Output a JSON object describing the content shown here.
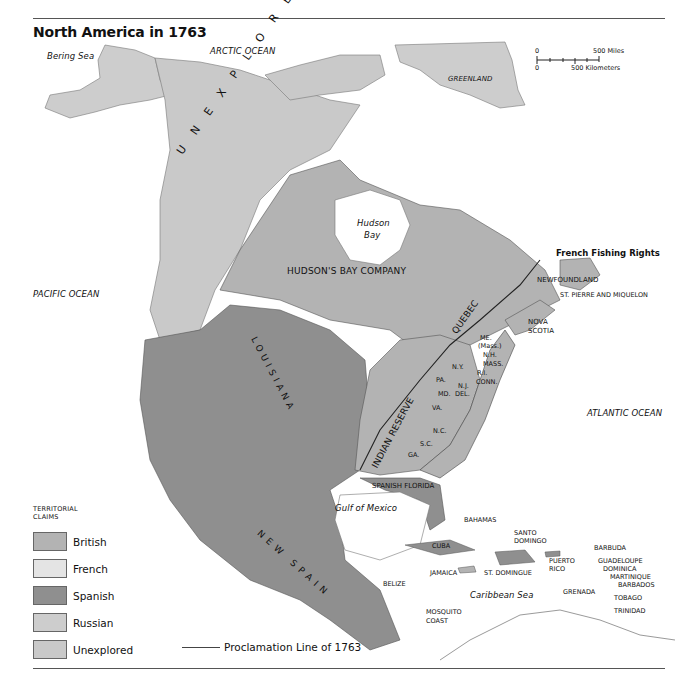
{
  "title": "North America in 1763",
  "colors": {
    "british": "#b3b3b3",
    "french": "#e4e4e4",
    "spanish": "#8f8f8f",
    "russian": "#cdcdcd",
    "unexplored": "#c9c9c9",
    "water": "#ffffff",
    "border": "#444444"
  },
  "scale": {
    "miles_zero": "0",
    "miles_label": "500 Miles",
    "km_zero": "0",
    "km_label": "500 Kilometers"
  },
  "oceans": {
    "bering": "Bering Sea",
    "arctic": "ARCTIC OCEAN",
    "pacific": "PACIFIC OCEAN",
    "atlantic": "ATLANTIC OCEAN",
    "gulf": "Gulf of Mexico",
    "caribbean": "Caribbean Sea",
    "hudson": "Hudson",
    "hudson2": "Bay"
  },
  "regions": {
    "greenland": "GREENLAND",
    "unexplored": "U N E X P L O R E D",
    "hbc": "HUDSON'S BAY COMPANY",
    "quebec": "QUEBEC",
    "louisiana": "LOUISIANA",
    "indian_reserve": "INDIAN RESERVE",
    "new_spain": "NEW SPAIN",
    "spanish_florida": "SPANISH FLORIDA",
    "newfoundland": "NEWFOUNDLAND",
    "st_pierre": "ST. PIERRE AND MIQUELON",
    "nova_scotia_1": "NOVA",
    "nova_scotia_2": "SCOTIA",
    "french_fishing": "French Fishing Rights",
    "belize": "BELIZE",
    "mosquito_1": "MOSQUITO",
    "mosquito_2": "COAST"
  },
  "colonies": {
    "me": "ME.",
    "mass_paren": "(Mass.)",
    "nh": "N.H.",
    "mass": "MASS.",
    "ri": "R.I.",
    "conn": "CONN.",
    "ny": "N.Y.",
    "pa": "PA.",
    "nj": "N.J.",
    "md": "MD.",
    "del": "DEL.",
    "va": "VA.",
    "nc": "N.C.",
    "sc": "S.C.",
    "ga": "GA."
  },
  "caribbean": {
    "bahamas": "BAHAMAS",
    "cuba": "CUBA",
    "jamaica": "JAMAICA",
    "santo_1": "SANTO",
    "santo_2": "DOMINGO",
    "st_domingue": "ST. DOMINGUE",
    "puerto_1": "PUERTO",
    "puerto_2": "RICO",
    "barbuda": "BARBUDA",
    "guadeloupe": "GUADELOUPE",
    "dominica": "DOMINICA",
    "martinique": "MARTINIQUE",
    "barbados": "BARBADOS",
    "grenada": "GRENADA",
    "tobago": "TOBAGO",
    "trinidad": "TRINIDAD"
  },
  "legend": {
    "heading_1": "TERRITORIAL",
    "heading_2": "CLAIMS",
    "items": [
      {
        "label": "British"
      },
      {
        "label": "French"
      },
      {
        "label": "Spanish"
      },
      {
        "label": "Russian"
      },
      {
        "label": "Unexplored"
      }
    ],
    "line_label": "Proclamation Line of 1763"
  }
}
